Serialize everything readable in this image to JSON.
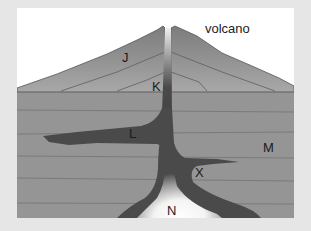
{
  "diagram": {
    "title": "volcano",
    "colors": {
      "page_background": "#e6e6e6",
      "sky": "#ffffff",
      "volcano_cone": "#8a8a8a",
      "ground_layers": "#959595",
      "magma": "#4a4a4a",
      "magma_chamber_glow": "#ffffff",
      "layer_lines": "#6e6e6e"
    },
    "labels": [
      {
        "id": "J",
        "text": "J",
        "x": 105,
        "y": 40,
        "description": "volcano cone upper layer"
      },
      {
        "id": "K",
        "text": "K",
        "x": 135,
        "y": 73,
        "description": "inner cone layer"
      },
      {
        "id": "L",
        "text": "L",
        "x": 112,
        "y": 120,
        "description": "horizontal magma sill"
      },
      {
        "id": "M",
        "text": "M",
        "x": 246,
        "y": 133,
        "description": "surrounding rock strata"
      },
      {
        "id": "X",
        "text": "X",
        "x": 178,
        "y": 158,
        "description": "branch magma dike"
      },
      {
        "id": "N",
        "text": "N",
        "x": 150,
        "y": 196,
        "description": "magma chamber"
      }
    ]
  }
}
